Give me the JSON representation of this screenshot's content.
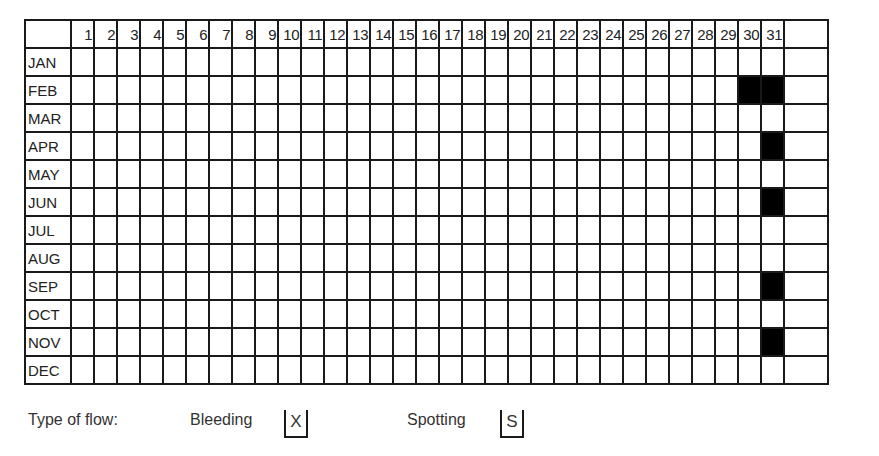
{
  "chart_data": {
    "type": "heatmap",
    "title": "",
    "rows": [
      "JAN",
      "FEB",
      "MAR",
      "APR",
      "MAY",
      "JUN",
      "JUL",
      "AUG",
      "SEP",
      "OCT",
      "NOV",
      "DEC"
    ],
    "columns": [
      "1",
      "2",
      "3",
      "4",
      "5",
      "6",
      "7",
      "8",
      "9",
      "10",
      "11",
      "12",
      "13",
      "14",
      "15",
      "16",
      "17",
      "18",
      "19",
      "20",
      "21",
      "22",
      "23",
      "24",
      "25",
      "26",
      "27",
      "28",
      "29",
      "30",
      "31",
      ""
    ],
    "filled_cells": [
      {
        "month": "FEB",
        "day": 30
      },
      {
        "month": "FEB",
        "day": 31
      },
      {
        "month": "APR",
        "day": 31
      },
      {
        "month": "JUN",
        "day": 31
      },
      {
        "month": "SEP",
        "day": 31
      },
      {
        "month": "NOV",
        "day": 31
      }
    ],
    "fill_color": "#000000",
    "grid": true
  },
  "legend": {
    "label": "Type of flow:",
    "items": [
      {
        "label": "Bleeding",
        "symbol": "X"
      },
      {
        "label": "Spotting",
        "symbol": "S"
      }
    ]
  }
}
